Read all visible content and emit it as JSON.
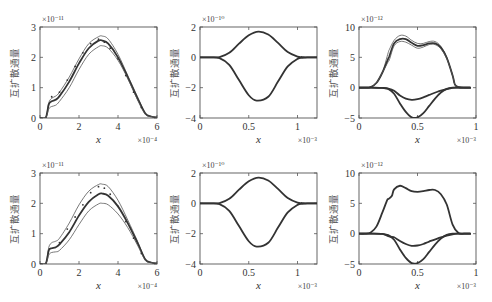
{
  "figure": {
    "ylabel": "互扩散通量",
    "xlabel": "x",
    "colors": {
      "line_dark": "#333333",
      "line_thin": "#555555",
      "frame": "#555555",
      "text": "#333333"
    }
  },
  "chart_data": [
    {
      "id": "top-left",
      "type": "line",
      "row": 0,
      "col": 0,
      "xlabel": "x",
      "ylabel": "互扩散通量",
      "x_exponent": "×10⁻⁴",
      "y_exponent": "×10⁻¹¹",
      "xlim": [
        0,
        6
      ],
      "ylim": [
        0,
        3
      ],
      "xticks": [
        "0",
        "2",
        "4",
        "6"
      ],
      "yticks": [
        "0",
        "1",
        "2",
        "3"
      ],
      "xtick_vals": [
        0,
        2,
        4,
        6
      ],
      "ytick_vals": [
        0,
        1,
        2,
        3
      ],
      "series": [
        {
          "name": "upper",
          "style": "thin",
          "x": [
            0,
            0.3,
            0.45,
            0.6,
            0.8,
            1.0,
            1.5,
            2.0,
            2.5,
            3.0,
            3.2,
            3.5,
            4.0,
            4.5,
            5.0,
            5.4,
            5.7,
            6.0
          ],
          "y": [
            0,
            0.02,
            0.5,
            0.65,
            0.72,
            0.85,
            1.35,
            1.95,
            2.45,
            2.68,
            2.7,
            2.6,
            2.1,
            1.4,
            0.7,
            0.15,
            0.05,
            0.02
          ]
        },
        {
          "name": "mean",
          "style": "bold",
          "x": [
            0,
            0.3,
            0.45,
            0.6,
            0.8,
            1.0,
            1.5,
            2.0,
            2.5,
            3.0,
            3.2,
            3.5,
            4.0,
            4.5,
            5.0,
            5.4,
            5.7,
            6.0
          ],
          "y": [
            0,
            0.02,
            0.45,
            0.55,
            0.6,
            0.72,
            1.2,
            1.8,
            2.3,
            2.55,
            2.55,
            2.45,
            2.0,
            1.35,
            0.65,
            0.15,
            0.05,
            0.02
          ]
        },
        {
          "name": "lower",
          "style": "thin",
          "x": [
            0,
            0.3,
            0.45,
            0.6,
            0.8,
            1.0,
            1.5,
            2.0,
            2.5,
            3.0,
            3.2,
            3.5,
            4.0,
            4.5,
            5.0,
            5.4,
            5.7,
            6.0
          ],
          "y": [
            0,
            0.02,
            0.3,
            0.38,
            0.42,
            0.55,
            1.0,
            1.6,
            2.1,
            2.35,
            2.38,
            2.3,
            1.9,
            1.3,
            0.6,
            0.12,
            0.05,
            0.02
          ]
        },
        {
          "name": "samples",
          "style": "dots",
          "x": [
            0.6,
            1.0,
            1.4,
            1.8,
            2.2,
            2.6,
            3.0,
            3.3,
            3.6,
            4.0,
            4.4,
            4.8,
            5.2
          ],
          "y": [
            0.7,
            0.85,
            1.25,
            1.7,
            2.15,
            2.45,
            2.6,
            2.5,
            2.3,
            1.95,
            1.4,
            0.85,
            0.35
          ]
        }
      ]
    },
    {
      "id": "top-middle",
      "type": "line",
      "row": 0,
      "col": 1,
      "xlabel": "x",
      "ylabel": "互扩散通量",
      "x_exponent": "×10⁻³",
      "y_exponent": "×10⁻¹⁰",
      "xlim": [
        0,
        1.2
      ],
      "ylim": [
        -4,
        2
      ],
      "xticks": [
        "0",
        "0.5",
        "1"
      ],
      "yticks": [
        "-4",
        "-2",
        "0",
        "2"
      ],
      "xtick_vals": [
        0,
        0.5,
        1
      ],
      "ytick_vals": [
        -4,
        -2,
        0,
        2
      ],
      "series": [
        {
          "name": "positive",
          "style": "bold",
          "x": [
            0,
            0.1,
            0.2,
            0.3,
            0.4,
            0.5,
            0.6,
            0.7,
            0.8,
            0.9,
            1.0,
            1.05,
            1.1,
            1.2
          ],
          "y": [
            0,
            0,
            0.02,
            0.3,
            0.9,
            1.45,
            1.7,
            1.5,
            0.95,
            0.35,
            0.05,
            0.02,
            0,
            0
          ]
        },
        {
          "name": "negative",
          "style": "bold",
          "x": [
            0,
            0.1,
            0.2,
            0.3,
            0.4,
            0.5,
            0.58,
            0.7,
            0.8,
            0.9,
            1.0,
            1.05,
            1.1,
            1.2
          ],
          "y": [
            0,
            0,
            -0.05,
            -0.5,
            -1.5,
            -2.5,
            -2.85,
            -2.6,
            -1.6,
            -0.6,
            -0.1,
            -0.03,
            0,
            0
          ]
        }
      ]
    },
    {
      "id": "top-right",
      "type": "line",
      "row": 0,
      "col": 2,
      "xlabel": "x",
      "ylabel": "互扩散通量",
      "x_exponent": "×10⁻³",
      "y_exponent": "×10⁻¹²",
      "xlim": [
        0,
        1
      ],
      "ylim": [
        -5,
        10
      ],
      "xticks": [
        "0",
        "0.5",
        "1"
      ],
      "yticks": [
        "-5",
        "0",
        "5",
        "10"
      ],
      "xtick_vals": [
        0,
        0.5,
        1
      ],
      "ytick_vals": [
        -5,
        0,
        5,
        10
      ],
      "series": [
        {
          "name": "upper",
          "style": "thin",
          "x": [
            0,
            0.05,
            0.1,
            0.15,
            0.2,
            0.25,
            0.26,
            0.3,
            0.35,
            0.4,
            0.45,
            0.5,
            0.55,
            0.6,
            0.65,
            0.7,
            0.75,
            0.8,
            0.82,
            0.85,
            0.9,
            0.95
          ],
          "y": [
            0,
            0,
            0.1,
            0.8,
            2.5,
            5.8,
            6.3,
            7.8,
            8.6,
            8.5,
            7.8,
            7.3,
            7.3,
            7.6,
            7.6,
            6.8,
            5.0,
            2.0,
            0.5,
            0.1,
            0,
            0
          ]
        },
        {
          "name": "mean",
          "style": "bold",
          "x": [
            0,
            0.05,
            0.1,
            0.15,
            0.2,
            0.25,
            0.26,
            0.3,
            0.35,
            0.4,
            0.45,
            0.5,
            0.55,
            0.6,
            0.65,
            0.7,
            0.75,
            0.8,
            0.82,
            0.85,
            0.9,
            0.95
          ],
          "y": [
            0,
            0,
            0.1,
            0.8,
            2.5,
            4.8,
            5.2,
            7.3,
            8.0,
            8.0,
            7.4,
            6.9,
            7.0,
            7.3,
            7.3,
            6.6,
            4.9,
            2.0,
            0.5,
            0.1,
            0,
            0
          ]
        },
        {
          "name": "lower",
          "style": "thin",
          "x": [
            0,
            0.05,
            0.1,
            0.15,
            0.2,
            0.25,
            0.26,
            0.3,
            0.35,
            0.4,
            0.45,
            0.5,
            0.55,
            0.6,
            0.65,
            0.7,
            0.75,
            0.8,
            0.82,
            0.85,
            0.9,
            0.95
          ],
          "y": [
            0,
            0,
            0.1,
            0.8,
            2.5,
            4.3,
            4.6,
            6.9,
            7.6,
            7.5,
            7.0,
            6.5,
            6.7,
            7.1,
            7.1,
            6.4,
            4.8,
            2.0,
            0.5,
            0.1,
            0,
            0
          ]
        },
        {
          "name": "negative-shallow",
          "style": "bold",
          "x": [
            0,
            0.1,
            0.2,
            0.25,
            0.3,
            0.35,
            0.4,
            0.45,
            0.5,
            0.55,
            0.6,
            0.7,
            0.8,
            0.85,
            0.95
          ],
          "y": [
            0,
            0,
            -0.05,
            -0.15,
            -0.5,
            -1.3,
            -1.8,
            -2.0,
            -1.9,
            -1.6,
            -1.2,
            -0.5,
            -0.05,
            0,
            0
          ]
        },
        {
          "name": "negative-deep",
          "style": "bold",
          "x": [
            0,
            0.1,
            0.2,
            0.25,
            0.3,
            0.35,
            0.4,
            0.45,
            0.5,
            0.55,
            0.6,
            0.65,
            0.7,
            0.75,
            0.8,
            0.85,
            0.95
          ],
          "y": [
            0,
            0,
            -0.05,
            -0.2,
            -1.0,
            -2.6,
            -4.0,
            -4.9,
            -4.9,
            -4.2,
            -3.0,
            -1.8,
            -0.8,
            -0.2,
            0,
            0,
            0
          ]
        }
      ]
    },
    {
      "id": "bottom-left",
      "type": "line",
      "row": 1,
      "col": 0,
      "xlabel": "x",
      "ylabel": "互扩散通量",
      "x_exponent": "×10⁻⁴",
      "y_exponent": "×10⁻¹¹",
      "xlim": [
        0,
        6
      ],
      "ylim": [
        0,
        3
      ],
      "xticks": [
        "0",
        "2",
        "4",
        "6"
      ],
      "yticks": [
        "0",
        "1",
        "2",
        "3"
      ],
      "xtick_vals": [
        0,
        2,
        4,
        6
      ],
      "ytick_vals": [
        0,
        1,
        2,
        3
      ],
      "series": [
        {
          "name": "upper",
          "style": "thin",
          "x": [
            0,
            0.3,
            0.45,
            0.6,
            0.8,
            1.0,
            1.5,
            2.0,
            2.5,
            3.0,
            3.2,
            3.5,
            4.0,
            4.5,
            5.0,
            5.4,
            5.7,
            6.0
          ],
          "y": [
            0,
            0.02,
            0.55,
            0.7,
            0.75,
            0.85,
            1.35,
            1.95,
            2.4,
            2.62,
            2.63,
            2.55,
            2.1,
            1.45,
            0.75,
            0.15,
            0.05,
            0.02
          ]
        },
        {
          "name": "mean",
          "style": "bold",
          "x": [
            0,
            0.3,
            0.45,
            0.6,
            0.8,
            1.0,
            1.5,
            2.0,
            2.5,
            3.0,
            3.2,
            3.5,
            4.0,
            4.5,
            5.0,
            5.4,
            5.7,
            6.0
          ],
          "y": [
            0,
            0.02,
            0.45,
            0.52,
            0.55,
            0.65,
            1.05,
            1.6,
            2.05,
            2.3,
            2.32,
            2.25,
            1.9,
            1.35,
            0.7,
            0.15,
            0.05,
            0.02
          ]
        },
        {
          "name": "lower",
          "style": "thin",
          "x": [
            0,
            0.3,
            0.45,
            0.6,
            0.8,
            1.0,
            1.5,
            2.0,
            2.5,
            3.0,
            3.2,
            3.5,
            4.0,
            4.5,
            5.0,
            5.4,
            5.7,
            6.0
          ],
          "y": [
            0,
            0.02,
            0.3,
            0.38,
            0.4,
            0.45,
            0.8,
            1.3,
            1.75,
            1.98,
            2.0,
            1.95,
            1.65,
            1.2,
            0.62,
            0.12,
            0.05,
            0.02
          ]
        },
        {
          "name": "samples",
          "style": "dots",
          "x": [
            0.5,
            1.0,
            1.4,
            1.8,
            2.2,
            2.6,
            3.0,
            3.3,
            3.6,
            4.0,
            4.4,
            4.8,
            5.2
          ],
          "y": [
            0.5,
            0.7,
            1.15,
            1.55,
            1.95,
            2.35,
            2.55,
            2.5,
            2.3,
            1.9,
            1.4,
            0.85,
            0.35
          ]
        }
      ]
    },
    {
      "id": "bottom-middle",
      "type": "line",
      "row": 1,
      "col": 1,
      "xlabel": "x",
      "ylabel": "互扩散通量",
      "x_exponent": "×10⁻³",
      "y_exponent": "×10⁻¹⁰",
      "xlim": [
        0,
        1.2
      ],
      "ylim": [
        -4,
        2
      ],
      "xticks": [
        "0",
        "0.5",
        "1"
      ],
      "yticks": [
        "-4",
        "-2",
        "0",
        "2"
      ],
      "xtick_vals": [
        0,
        0.5,
        1
      ],
      "ytick_vals": [
        -4,
        -2,
        0,
        2
      ],
      "series": [
        {
          "name": "positive",
          "style": "bold",
          "x": [
            0,
            0.1,
            0.2,
            0.3,
            0.4,
            0.5,
            0.6,
            0.7,
            0.8,
            0.9,
            1.0,
            1.05,
            1.1,
            1.2
          ],
          "y": [
            0,
            0,
            0.02,
            0.3,
            0.9,
            1.45,
            1.7,
            1.5,
            0.95,
            0.35,
            0.05,
            0.02,
            0,
            0
          ]
        },
        {
          "name": "negative",
          "style": "bold",
          "x": [
            0,
            0.1,
            0.2,
            0.3,
            0.4,
            0.5,
            0.58,
            0.7,
            0.8,
            0.9,
            1.0,
            1.05,
            1.1,
            1.2
          ],
          "y": [
            0,
            0,
            -0.05,
            -0.5,
            -1.5,
            -2.5,
            -2.85,
            -2.6,
            -1.6,
            -0.6,
            -0.1,
            -0.03,
            0,
            0
          ]
        }
      ]
    },
    {
      "id": "bottom-right",
      "type": "line",
      "row": 1,
      "col": 2,
      "xlabel": "x",
      "ylabel": "互扩散通量",
      "x_exponent": "×10⁻³",
      "y_exponent": "×10⁻¹²",
      "xlim": [
        0,
        1
      ],
      "ylim": [
        -5,
        10
      ],
      "xticks": [
        "0",
        "0.5",
        "1"
      ],
      "yticks": [
        "-5",
        "0",
        "5",
        "10"
      ],
      "xtick_vals": [
        0,
        0.5,
        1
      ],
      "ytick_vals": [
        -5,
        0,
        5,
        10
      ],
      "series": [
        {
          "name": "positive",
          "style": "bold",
          "x": [
            0,
            0.05,
            0.1,
            0.15,
            0.2,
            0.24,
            0.25,
            0.28,
            0.3,
            0.35,
            0.4,
            0.45,
            0.5,
            0.55,
            0.6,
            0.65,
            0.7,
            0.75,
            0.8,
            0.85,
            0.9,
            0.95
          ],
          "y": [
            0,
            0,
            0.2,
            1.2,
            3.5,
            5.5,
            5.7,
            6.2,
            7.3,
            7.9,
            7.5,
            7.0,
            6.9,
            7.0,
            7.2,
            7.2,
            6.5,
            4.8,
            1.5,
            0.1,
            0,
            0
          ]
        },
        {
          "name": "negative-shallow",
          "style": "bold",
          "x": [
            0,
            0.1,
            0.2,
            0.25,
            0.28,
            0.3,
            0.35,
            0.4,
            0.45,
            0.5,
            0.55,
            0.6,
            0.7,
            0.8,
            0.85,
            0.95
          ],
          "y": [
            0,
            0,
            -0.05,
            -0.4,
            -0.55,
            -0.6,
            -1.2,
            -1.7,
            -2.0,
            -1.95,
            -1.7,
            -1.3,
            -0.6,
            -0.1,
            0,
            0
          ]
        },
        {
          "name": "negative-deep",
          "style": "bold",
          "x": [
            0,
            0.1,
            0.2,
            0.25,
            0.3,
            0.35,
            0.4,
            0.45,
            0.5,
            0.55,
            0.6,
            0.65,
            0.7,
            0.75,
            0.8,
            0.85,
            0.95
          ],
          "y": [
            0,
            0,
            -0.05,
            -0.25,
            -1.0,
            -2.6,
            -4.0,
            -4.85,
            -4.85,
            -4.2,
            -3.0,
            -1.8,
            -0.8,
            -0.2,
            0,
            0,
            0
          ]
        }
      ]
    }
  ]
}
